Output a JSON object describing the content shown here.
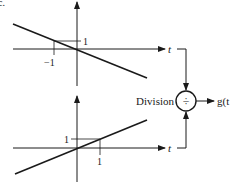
{
  "figure_label": "c.",
  "top_graph": {
    "axis_label": "t",
    "y_tick_label": "1",
    "x_tick_label": "−1",
    "slope": -1
  },
  "bottom_graph": {
    "axis_label": "t",
    "y_tick_label": "1",
    "x_tick_label": "1",
    "slope": 1
  },
  "operator": {
    "label": "Division",
    "symbol": "÷"
  },
  "output": {
    "label": "g(t"
  },
  "colors": {
    "stroke": "#1a1a1a",
    "background": "#ffffff"
  }
}
